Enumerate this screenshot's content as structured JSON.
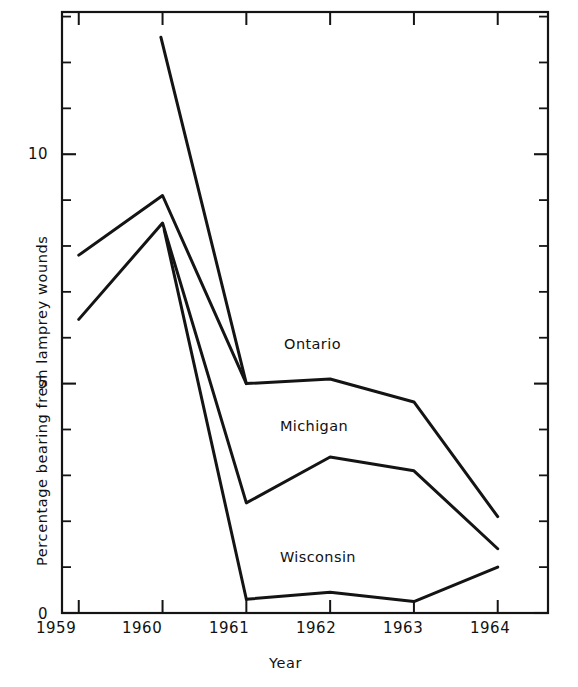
{
  "chart_data": {
    "type": "line",
    "title": "",
    "xlabel": "Year",
    "ylabel": "Percentage bearing fresh lamprey wounds",
    "categories": [
      "1959",
      "1960",
      "1961",
      "1962",
      "1963",
      "1964"
    ],
    "x": [
      1959,
      1960,
      1961,
      1962,
      1963,
      1964
    ],
    "xlim": [
      1958.8,
      1964.6
    ],
    "ylim": [
      0,
      13.1
    ],
    "grid": false,
    "legend_position": "inline-annotations",
    "y_ticks_major": [
      0,
      5,
      10
    ],
    "y_ticks_major_labels": [
      "0",
      "5",
      "10"
    ],
    "y_tick_minor_step": 1,
    "x_tick_labels": [
      "1959",
      "1960",
      "1961",
      "1962",
      "1963",
      "1964"
    ],
    "series": [
      {
        "name": "Ontario",
        "color": "#111111",
        "values": [
          7.8,
          9.1,
          5.0,
          5.1,
          4.6,
          2.1
        ],
        "label_x": 1961.45,
        "label_y": 5.85
      },
      {
        "name": "Michigan",
        "color": "#111111",
        "values": [
          6.4,
          8.5,
          2.4,
          3.4,
          3.1,
          1.4
        ],
        "label_x": 1961.4,
        "label_y": 4.05
      },
      {
        "name": "Wisconsin",
        "color": "#111111",
        "values": [
          null,
          null,
          0.3,
          0.45,
          0.25,
          1.0
        ],
        "label_x": 1961.4,
        "label_y": 1.2
      }
    ]
  },
  "axis": {
    "x_title": "Year",
    "y_title": "Percentage bearing fresh lamprey wounds"
  },
  "labels": {
    "y0": "0",
    "y5": "5",
    "y10": "10",
    "x1959": "1959",
    "x1960": "1960",
    "x1961": "1961",
    "x1962": "1962",
    "x1963": "1963",
    "x1964": "1964",
    "ontario": "Ontario",
    "michigan": "Michigan",
    "wisconsin": "Wisconsin"
  }
}
